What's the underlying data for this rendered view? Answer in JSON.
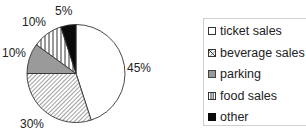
{
  "chart_data": {
    "type": "pie",
    "title": "",
    "categories": [
      "ticket sales",
      "beverage sales",
      "parking",
      "food sales",
      "other"
    ],
    "values": [
      45,
      30,
      10,
      10,
      5
    ],
    "labels": [
      "45%",
      "30%",
      "10%",
      "10%",
      "5%"
    ],
    "fills": [
      "white",
      "diagonal-hatch",
      "gray",
      "vertical-stripes",
      "black"
    ],
    "start_angle_deg": 0,
    "direction": "clockwise",
    "legend_position": "right"
  },
  "legend": {
    "items": [
      {
        "label": "ticket sales"
      },
      {
        "label": "beverage sales"
      },
      {
        "label": "parking"
      },
      {
        "label": "food sales"
      },
      {
        "label": "other"
      }
    ]
  },
  "colors": {
    "outline": "#333333",
    "gray": "#9a9a9a",
    "black": "#0a0a0a",
    "white": "#ffffff"
  }
}
